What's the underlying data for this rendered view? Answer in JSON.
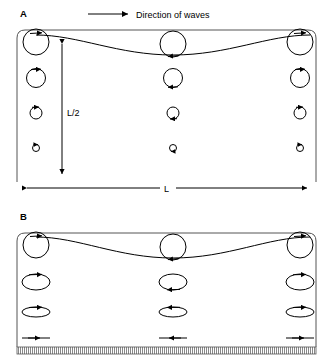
{
  "figure": {
    "type": "wave-orbital-motion-diagram",
    "width": 333,
    "height": 364,
    "background": "#ffffff",
    "stroke_color": "#000000"
  },
  "annotations": {
    "direction_label": "Direction of waves",
    "direction_arrow": "arrow-right",
    "depth_label": "L/2",
    "wavelength_label": "L"
  },
  "panels": [
    {
      "id": "A",
      "label": "A",
      "caption_scenario": "deep water",
      "water_box": {
        "x": 17,
        "y": 30,
        "width": 299,
        "height": 152,
        "corner_radius": 8,
        "open_bottom": true
      },
      "wave": {
        "crest_y": 35,
        "trough_y": 55,
        "crest_positions": [
          36,
          300
        ],
        "trough_position": 173,
        "arrowheads": [
          {
            "x": 36,
            "y": 35,
            "dir": "right"
          },
          {
            "x": 173,
            "y": 55,
            "dir": "right"
          },
          {
            "x": 300,
            "y": 35,
            "dir": "right"
          }
        ]
      },
      "orbit_columns": [
        36,
        173,
        300
      ],
      "orbit_rows": [
        {
          "cy": 42,
          "rx": 13,
          "ry": 13,
          "arrow_at": [
            "top",
            "bottom",
            "top"
          ]
        },
        {
          "cy": 78,
          "rx": 9.5,
          "ry": 9.5,
          "arrow_at": [
            "top",
            "bottom",
            "top"
          ]
        },
        {
          "cy": 113,
          "rx": 6,
          "ry": 6,
          "arrow_at": [
            "top",
            "bottom",
            "top"
          ]
        },
        {
          "cy": 148,
          "rx": 3.5,
          "ry": 3.5,
          "arrow_at": [
            "top",
            "bottom",
            "top"
          ]
        }
      ],
      "depth_arrow": {
        "x": 62,
        "y_top": 40,
        "y_bottom": 178,
        "double_headed": true,
        "label": "L/2",
        "label_x": 68,
        "label_y": 113
      },
      "wavelength_arrow": {
        "y": 188,
        "x_left": 27,
        "x_right": 307,
        "double_headed": true,
        "label": "L",
        "label_x": 167
      }
    },
    {
      "id": "B",
      "label": "B",
      "caption_scenario": "shallow water",
      "water_box": {
        "x": 17,
        "y": 233,
        "width": 299,
        "height": 110,
        "corner_radius": 8,
        "open_bottom": true
      },
      "wave": {
        "crest_y": 237,
        "trough_y": 258,
        "crest_positions": [
          36,
          300
        ],
        "trough_position": 173,
        "arrowheads": [
          {
            "x": 36,
            "y": 237,
            "dir": "right"
          },
          {
            "x": 173,
            "y": 258,
            "dir": "right"
          },
          {
            "x": 300,
            "y": 237,
            "dir": "right"
          }
        ]
      },
      "orbit_columns": [
        36,
        173,
        300
      ],
      "orbit_rows": [
        {
          "cy": 245,
          "rx": 13,
          "ry": 13,
          "arrow_at": [
            "top",
            "bottom",
            "top"
          ]
        },
        {
          "cy": 282,
          "rx": 14,
          "ry": 8,
          "arrow_at": [
            "top",
            "bottom",
            "top"
          ]
        },
        {
          "cy": 312,
          "rx": 14,
          "ry": 5,
          "arrow_at": [
            "top",
            "bottom",
            "top"
          ]
        },
        {
          "cy": 338,
          "rx": 14,
          "ry": 0,
          "arrow_at": [
            "top",
            "bottom",
            "top"
          ],
          "flat": true
        }
      ],
      "seabed": {
        "x": 17,
        "y": 347,
        "width": 299,
        "height": 7,
        "pattern": "vertical-hatch"
      }
    }
  ]
}
